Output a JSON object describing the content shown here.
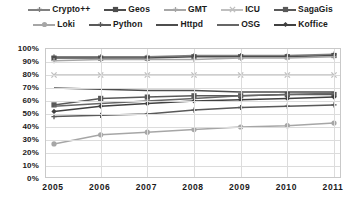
{
  "chart_data": {
    "type": "line",
    "title": "",
    "xlabel": "",
    "ylabel": "",
    "x": [
      2005,
      2006,
      2007,
      2008,
      2009,
      2010,
      2011
    ],
    "categories": [
      "2005",
      "2006",
      "2007",
      "2008",
      "2009",
      "2010",
      "2011"
    ],
    "ylim": [
      0,
      100
    ],
    "yticks": [
      0,
      10,
      20,
      30,
      40,
      50,
      60,
      70,
      80,
      90,
      100
    ],
    "ytick_labels": [
      "0%",
      "10%",
      "20%",
      "30%",
      "40%",
      "50%",
      "60%",
      "70%",
      "80%",
      "90%",
      "100%"
    ],
    "grid": true,
    "legend_position": "top",
    "legend_columns": 5,
    "legend_rows": 2,
    "series": [
      {
        "name": "Crypto++",
        "marker": "plus",
        "color": "#808080",
        "values": [
          94,
          94,
          94,
          95,
          95,
          95,
          96
        ]
      },
      {
        "name": "Geos",
        "marker": "square",
        "color": "#4d4d4d",
        "values": [
          93,
          93,
          93,
          94,
          94,
          94,
          95
        ]
      },
      {
        "name": "GMT",
        "marker": "plus",
        "color": "#a6a6a6",
        "values": [
          91,
          92,
          92,
          92,
          93,
          93,
          94
        ]
      },
      {
        "name": "ICU",
        "marker": "cross",
        "color": "#bfbfbf",
        "values": [
          80,
          80,
          80,
          80,
          80,
          80,
          80
        ]
      },
      {
        "name": "SagaGis",
        "marker": "square",
        "color": "#595959",
        "values": [
          57,
          62,
          63,
          64,
          64,
          65,
          65
        ]
      },
      {
        "name": "Loki",
        "marker": "circle",
        "color": "#a6a6a6",
        "values": [
          27,
          34,
          36,
          38,
          40,
          41,
          43
        ]
      },
      {
        "name": "Python",
        "marker": "plus",
        "color": "#595959",
        "values": [
          48,
          49,
          50,
          53,
          55,
          56,
          57
        ]
      },
      {
        "name": "Httpd",
        "marker": "none",
        "color": "#4d4d4d",
        "values": [
          70,
          69,
          68,
          68,
          67,
          67,
          67
        ]
      },
      {
        "name": "OSG",
        "marker": "none",
        "color": "#666666",
        "values": [
          56,
          58,
          60,
          62,
          64,
          65,
          66
        ]
      },
      {
        "name": "Koffice",
        "marker": "diamond",
        "color": "#404040",
        "values": [
          52,
          56,
          58,
          60,
          61,
          62,
          63
        ]
      }
    ]
  }
}
